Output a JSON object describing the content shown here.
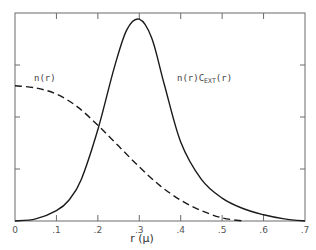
{
  "chart_data": {
    "type": "line",
    "title": "",
    "xlabel": "r (μ)",
    "ylabel": "",
    "xlim": [
      0,
      0.7
    ],
    "ylim": [
      0,
      1
    ],
    "grid": false,
    "legend": "none (curves labeled inline)",
    "x_ticks": [
      0,
      0.1,
      0.2,
      0.3,
      0.4,
      0.5,
      0.6,
      0.7
    ],
    "x_tick_labels": [
      "0",
      ".1",
      ".2",
      ".3",
      ".4",
      ".5",
      ".6",
      ".7"
    ],
    "y_ticks": [
      0.25,
      0.5,
      0.75
    ],
    "y_tick_labels": [],
    "series": [
      {
        "name": "n(r)",
        "style": "dashed",
        "x": [
          0,
          0.05,
          0.1,
          0.15,
          0.2,
          0.25,
          0.3,
          0.35,
          0.4,
          0.45,
          0.5,
          0.55
        ],
        "values": [
          0.65,
          0.64,
          0.61,
          0.55,
          0.46,
          0.36,
          0.26,
          0.17,
          0.1,
          0.05,
          0.015,
          0.0
        ]
      },
      {
        "name": "n(r)C_EXT(r)",
        "style": "solid",
        "x": [
          0,
          0.05,
          0.1,
          0.13,
          0.16,
          0.2,
          0.24,
          0.27,
          0.3,
          0.33,
          0.36,
          0.4,
          0.45,
          0.5,
          0.55,
          0.6,
          0.65,
          0.7
        ],
        "values": [
          0.0,
          0.01,
          0.05,
          0.1,
          0.2,
          0.44,
          0.74,
          0.92,
          0.97,
          0.88,
          0.66,
          0.38,
          0.2,
          0.11,
          0.06,
          0.03,
          0.01,
          0.0
        ]
      }
    ],
    "annotations": [
      {
        "text": "n(r)",
        "x": 0.05,
        "y": 0.7
      },
      {
        "text": "n(r)C",
        "sub": "EXT",
        "suffix": "(r)",
        "x": 0.39,
        "y": 0.7
      }
    ]
  },
  "labels": {
    "xlabel": "r (μ)",
    "nr": "n(r)",
    "nrc_main": "n(r)C",
    "nrc_sub": "EXT",
    "nrc_suffix": "(r)"
  }
}
